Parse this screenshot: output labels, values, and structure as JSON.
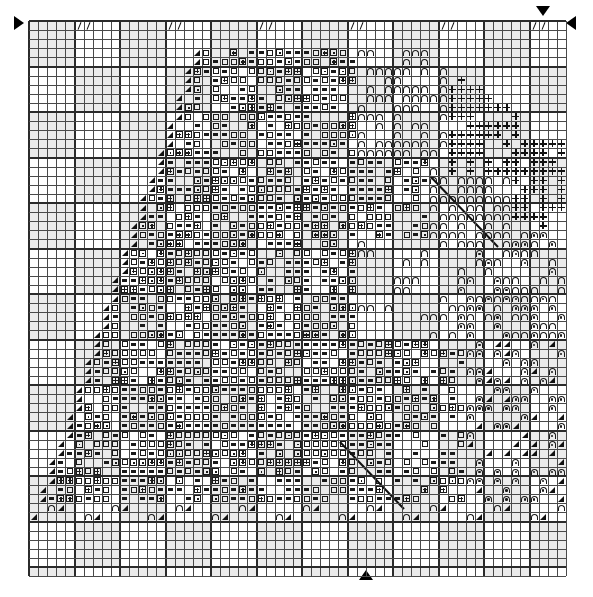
{
  "document": {
    "kind": "cross-stitch-pattern-chart",
    "title": "",
    "width_px": 593,
    "height_px": 597
  },
  "chart": {
    "origin_x": 29,
    "origin_y": 21,
    "cell_size": 9.1,
    "columns": 59,
    "rows": 61,
    "major_gridline_every": 5,
    "colors": {
      "background": "#ffffff",
      "minor_grid": "#6e6e6e",
      "major_grid": "#2b2b2b",
      "shaded_cell": "#ebebeb",
      "symbol_ink": "#1a1a1a",
      "marker": "#000000"
    }
  },
  "legend": {
    "symbols": [
      {
        "key": "dash",
        "glyph": "▬",
        "name": "dash-symbol"
      },
      {
        "key": "box",
        "glyph": "□",
        "name": "open-square-symbol"
      },
      {
        "key": "boxplus",
        "glyph": "⊞",
        "name": "square-plus-symbol"
      },
      {
        "key": "eye",
        "glyph": "⊡",
        "name": "square-dot-symbol"
      },
      {
        "key": "plus",
        "glyph": "+",
        "name": "plus-symbol"
      },
      {
        "key": "I",
        "glyph": "I",
        "name": "capital-i-symbol"
      },
      {
        "key": "arch",
        "glyph": "∩",
        "name": "arch-symbol"
      },
      {
        "key": "shoe",
        "glyph": "⊓",
        "name": "arch-dot-symbol"
      },
      {
        "key": "tri",
        "glyph": "◢",
        "name": "triangle-symbol"
      },
      {
        "key": "slash",
        "glyph": "/",
        "name": "slash-symbol"
      }
    ]
  },
  "markers": [
    {
      "name": "center-marker-top",
      "dir": "down",
      "x": 536,
      "y": 6
    },
    {
      "name": "center-marker-bottom",
      "dir": "up",
      "x": 359,
      "y": 570
    },
    {
      "name": "center-marker-left",
      "dir": "right",
      "x": 14,
      "y": 16
    },
    {
      "name": "center-marker-right",
      "dir": "left",
      "x": 566,
      "y": 16
    }
  ],
  "backstitch": [
    {
      "name": "backstitch-line-1",
      "x1": 430,
      "y1": 176,
      "x2": 498,
      "y2": 247
    },
    {
      "name": "backstitch-line-2",
      "x1": 340,
      "y1": 442,
      "x2": 404,
      "y2": 509
    }
  ],
  "chart_data": {
    "type": "heatmap",
    "xlabel": "stitch column",
    "ylabel": "stitch row",
    "columns": 59,
    "rows": 61,
    "legend_position": "none",
    "grid": true,
    "symbol_keys": [
      "dash",
      "box",
      "boxplus",
      "eye",
      "plus",
      "I",
      "arch",
      "shoe",
      "tri",
      "slash",
      "hash"
    ],
    "rows_data": [
      "......I.I..//..I.I..//..I.I..//..I.I..//..I.I.aaaaaa...aaaaaa..I.I",
      ".......I....I....I....I....I....I....I....I...aaaaaa...aaaaaa...I.",
      "........I.I..//..I.I..//..I.I..//..I.I..//..I.aaaaaa...aaaaaa..I.I",
      "........t..........................................aaaa....aa+++..",
      ".......t......ddddd.dd..ddd.......................aa.....+++++++..",
      "......t.....bbbbbbbbbbbbbbb.....ddd.d...........aa.....+++++++.II.",
      ".....t.....bbbbbbbbbbbbbbbbb...dddddd..........aa....+++++++..IIII",
      "....t.....bbbbbbbbbbbbbbbbbbb.ddddddd.........aa...+++++++...IIIII",
      "....t....bbbbbbbbbbbbbbbbbbbbbddddddd........aa..+++++++....IIIIII",
      "...t....bbbbbbbbbbbbbbbbbbbbbbddddddd.......aa..+++++.....IIIIIIII",
      "...t...bbbbbbbbbbbbbbbbbbbbbbbdddddd.......aa..++++......IIIIIIIII",
      "..t...bbbbbbbbbbbbbbbbbbbbbbbbddddd.......aa..++........IIIIIIIIII",
      "..t..bbbbbbbbbbbbbbbbbbbbbbbbbdddd.......aa...........IIIIIIII.+++",
      ".t..bbbbbbbbbbbbbbbbbbbbbbbbbbddd.......aa...........IIIIIII..++++",
      ".t.bbbbbbbbbbbbbbbbbbbbbbbbbbbdd.......aa..........IIIIII....+++++",
      "t.bbbbbbbbbbbbbbbbbbbbbbbbbbbbd.......aaa.........IIII......++++++",
      "t.bbbbbbbbbbbbbbbbbbbbbbbbbbbb.......aaaaa.......II........++++++.",
      ".bbbbbbbbbbbbbbbbbbbbbbbbbbbb.......aaaaaaa..............+++++++..",
      ".bbbbbbbbbbbbbbbbbbbbbbbbbbb.......aaaaaaaaa............+++++++...",
      "bbbbbbbbbbbbbbbbbbbbbbbbbbb.......aaaaaaaaaaa..........+++++++....",
      "bbbbbbbbbbbbbbbbbbbbbbbbbb.......aaaaaaaaaaaaa........++++++.....a",
      "bbbbbbbbbbbbbbbbbbbbbbbbb.......aaaaaaaaaaaaaaa......+++++......aa",
      "bbbbbbbbbbbbbbbbbbbbbbbb.......aaaaaaaaaaaaaaaaa....++++.......aaa",
      "bbbbbbbbbbbbbbbbbbbbbbb.......aaaaaaaaaaaaaaaaaaa..+++........aaaa",
      "bbbbbbbbbbbbbbbbbbbbbb.......aaaaaaaaaaaaaaaaaaaaa.++........aaaaa",
      "bbbbbbbbbbbbbbbbbbbbb.......aaaaaaaaaaaaaaaaaaaaaaa........aaaaaaa",
      "bbbbbbbbbbbbbbbbbbbb.......aaaaaaaaaaaaaaaaaaaaaaaa.......aaaaaaaa",
      "bbbbbbbbbbbbbbbbbbb.......aaaaaaaaaaaaaaaaaaaaaaaaa......aaaaaaaaa",
      "bbbbbbbbbbbbbbbbbb.......aaaaaaaaaaaaaaaaaaaaaaaaaa.....aaaaaaaaaa",
      "bbbbbbbbbbbbbbbbb.......aaaaaaaaaaaaaaaaaaaaaaaaaaa....aaaaaaaaaaa",
      "bbbbbbbbbbbbbbbb.......aaaaaaaaaaaaaaaaaaaaaaaaaaaa...aaaaaaaaaaaa",
      "bbbbbbbbbbbbbbb.......aaaaaaaaaaaaaaaaaaaaaaaaaaaaa..aaaaaaaaaaaaa",
      "bbbbbbbbbbbbbb.......aaaaaaaaaaaaaaaaaaaaaaaaaaaaaa.aaaaaaaaaaaaaa",
      "bbbbbbbbbbbbb.......aaaaaaaaaaaaaaaaaaaaaaaaaaaaaaaaaaaaaaaaaaaaaa",
      "bbbbbbbbbbbb.......aaaaaaaaaaaaaaaaaaaaaaaaaaaaaaaaaaaaaaaaaaaaaaa",
      "bbbbbbbbbbb.......aaaaaaaaaaaaaaaaaaaaaaaaaaaaaaaaaaaaaaaaaaaaaaaa",
      "bbbbbbbbbb.......aaaaaaaaaaaaaaaaaaaaaaaaaaaaaaaaaaaaaaaaaaaaaaaaa",
      "bbbbbbbbb.......aaaaaaaaaaaaaaaaaaaaaaaaaaaaaaaaaaaaaaaaaaaaaaaaaa",
      "bbbbbbbb.......aaaaaaaaaaaaaaaaaaaaaaaaaaaaaaaaaaaaaaaaaaaaaaaaaaa",
      "bbbbbbb.......aaaaaaaaaaaaaaaaaaaaaaaaaaaaaaaaaaaaaaaaaaaaaaaaaaaa",
      "bbbbbb.......aaaaaaaaaaaaaaaaaaaaaaaaaaaaaaaaaaaaaaaaaaaaaaaaaaaaa",
      "bbbbb.......aaaaaaaaaaaaaaaaaaaaaaaaaaaaaaaaaaaaaaaaaaaaaaaaaaaaaa",
      "bbbb.......aaaaaaaaaaaaaaaaaaaaaaaaaaaaaaaaaaaaaaaaaaaaaaaaaaaaaaa",
      "bbb.......aaaaaaaaaaaaaaaaaaaaaaaaaaaaaaaaaaaaaaaaaaaaaaaaaaaaaaaa",
      "bb.......aaaaaaaaaaaaaaaaaaaaaaaaaaaaaaaaaaaaaaaaaaaaaaaaaaaaaaaaa",
      "b.......aaaaaaaaaaaaaaaaaaaaaaaaaaaaaaaaaaaaaaaaaaaaaaaaaaaaaaaaaa",
      ".......aaaaaaaaaaaaaaaaaaaaaaaaaaaaaaaaaaaaaaaaaaaaaaaaaaaaaaaaaaa",
      "......aaaaaaaaaaaaaaaaaaaaaaaaaaaaaaaaaaaaaaaaaaaaaaaaaaaaaaaaaaaa",
      ".....aaaaaaaaaaaaaaaaaaaaaaaaaaaaaaaaaaaaaaaaaaaaaaaaaaaaaaaaaaaaa",
      "....aaaaaaaaaaaaaaaaaaaaaaaaaaaaaaaaaaaaaaaaaaaaaaaaaaaaaaaaaaaaaa",
      "...aaaaaaaaaaaaaaaaaaaaaaaaaaaaaaaaaaaaaaaaaaaaaaaaaaaaaaaaaaaaaaa",
      "..aaaaaaaaaaaaaaaaaaaaaaaaaaaaaaaaaaaaaaaaaaaaaaaaaaaaaaaaaaaaaaaa",
      ".aaaaaaaaaaaaaaaaaaaaaaaaaaaaaaaaaaaaaaaaaaaaaaaaaaaaaaaaaaaaaaaaa",
      "aaaaaaaaaaaaaaaaaaaaaaaaaaaaaaaaaaaaaaaaaaaaaaaaaaaaaaaaaaaaaaaaaa",
      "..................................................................",
      "..................................................................",
      "..................................................................",
      "..................................................................",
      "..................................................................",
      "..................................................................",
      ".................................................................."
    ]
  }
}
